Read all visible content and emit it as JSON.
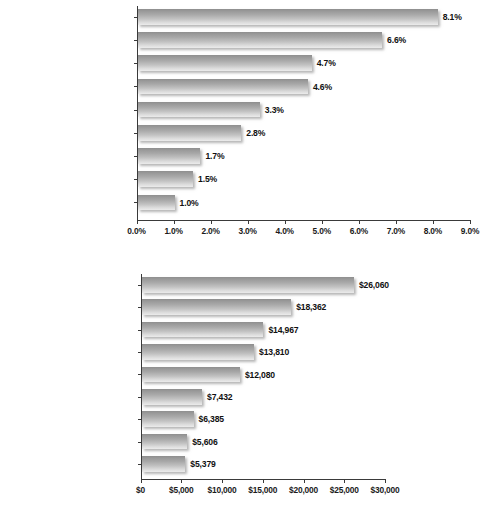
{
  "page": {
    "background": "#ffffff",
    "bar_color_dark": "#8e8e8e",
    "bar_color_light": "#ebebeb",
    "text_color": "#1b1b1b"
  },
  "chart_data": [
    {
      "id": "top",
      "type": "bar",
      "orientation": "horizontal",
      "title": "",
      "subtitle": "",
      "xlabel": "",
      "ylabel": "",
      "grid": false,
      "legend": "none",
      "xlim": [
        0,
        9
      ],
      "categories": [
        "Software Publishing and\nInternet Services",
        "Banking and Finance",
        "Education",
        "Media and Entertainment",
        "Pharmaceuticals",
        "Transportation",
        "Manufacturing",
        "Retail and Wholesale",
        "Energy"
      ],
      "values": [
        8.1,
        6.6,
        4.7,
        4.6,
        3.3,
        2.8,
        1.7,
        1.5,
        1.0
      ],
      "data_labels": [
        "8.1%",
        "6.6%",
        "4.7%",
        "4.6%",
        "3.3%",
        "2.8%",
        "1.7%",
        "1.5%",
        "1.0%"
      ],
      "tick_values": [
        0,
        1,
        2,
        3,
        4,
        5,
        6,
        7,
        8,
        9
      ],
      "tick_labels": [
        "0.0%",
        "1.0%",
        "2.0%",
        "3.0%",
        "4.0%",
        "5.0%",
        "6.0%",
        "7.0%",
        "8.0%",
        "9.0%"
      ]
    },
    {
      "id": "bottom",
      "type": "bar",
      "orientation": "horizontal",
      "title": "",
      "subtitle": "",
      "xlabel": "",
      "ylabel": "",
      "grid": false,
      "legend": "none",
      "xlim": [
        0,
        30000
      ],
      "categories": [
        "Banking and Finance",
        "Software Publishing and\nInternet Services",
        "Media and Entertainment",
        "Energy",
        "Pharmaceuticals",
        "Transportation",
        "Education",
        "Manufacturing",
        "Retail and Wholesale"
      ],
      "values": [
        26060,
        18362,
        14967,
        13810,
        12080,
        7432,
        6385,
        5606,
        5379
      ],
      "data_labels": [
        "$26,060",
        "$18,362",
        "$14,967",
        "$13,810",
        "$12,080",
        "$7,432",
        "$6,385",
        "$5,606",
        "$5,379"
      ],
      "tick_values": [
        0,
        5000,
        10000,
        15000,
        20000,
        25000,
        30000
      ],
      "tick_labels": [
        "$0",
        "$5,000",
        "$10,000",
        "$15,000",
        "$20,000",
        "$25,000",
        "$30,000"
      ]
    }
  ]
}
